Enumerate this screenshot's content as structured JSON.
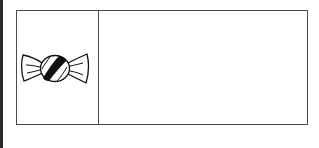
{
  "figure": {
    "cells": [
      {
        "content": "candy-icon"
      },
      {
        "content": ""
      }
    ]
  }
}
